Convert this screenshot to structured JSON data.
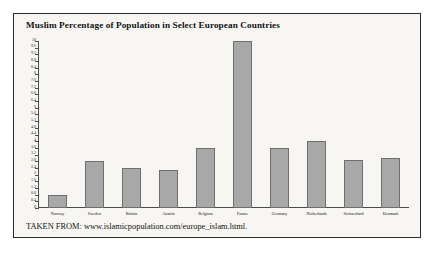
{
  "figure": {
    "source_note": "TAKEN FROM: www.islamicpopulation.com/europe_islam.html.",
    "frame_color": "#2b2b2b",
    "background_color": "#f7f6f3",
    "bar_fill_color": "#a8a8a8",
    "bar_edge_color": "#6f6f6f"
  },
  "chart_data": {
    "type": "bar",
    "title": "Muslim Percentage of Population in Select European Countries",
    "xlabel": "",
    "ylabel": "",
    "ylim": [
      0,
      10
    ],
    "ytick_step": 0.4,
    "grid": false,
    "legend": false,
    "categories": [
      "Norway",
      "Sweden",
      "Britain",
      "Austria",
      "Belgium",
      "France",
      "Germany",
      "Netherlands",
      "Switzerland",
      "Denmark"
    ],
    "values": [
      0.8,
      2.8,
      2.4,
      2.3,
      3.6,
      10.0,
      3.6,
      4.0,
      2.9,
      3.0
    ],
    "yticks": [
      "10",
      "9.6",
      "9.2",
      "8.8",
      "8.4",
      "8",
      "7.6",
      "7.2",
      "6.8",
      "6.4",
      "6",
      "5.6",
      "5.2",
      "4.8",
      "4.4",
      "4",
      "3.6",
      "3.2",
      "2.8",
      "2.4",
      "2",
      "1.6",
      "1.2",
      "0.8",
      "0.4",
      "0"
    ]
  }
}
